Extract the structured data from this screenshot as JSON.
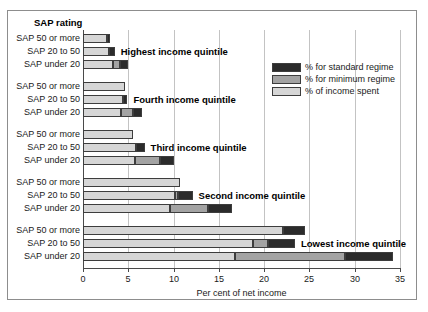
{
  "figure": {
    "sap_rating_title": "SAP rating",
    "axis_title": "Per cent of net income"
  },
  "legend": {
    "position": "top-right-inside",
    "items": [
      {
        "label": "% for standard regime",
        "color": "#2b2b2b",
        "key": "standard"
      },
      {
        "label": "% for minimum regime",
        "color": "#a3a3a3",
        "key": "minimum"
      },
      {
        "label": "% of income spent",
        "color": "#d6d6d6",
        "key": "spent"
      }
    ]
  },
  "chart_data": {
    "type": "bar",
    "orientation": "horizontal",
    "stacked": true,
    "title": "",
    "xlabel": "Per cent of net income",
    "ylabel": "SAP rating",
    "xlim": [
      0,
      35
    ],
    "xticks": [
      0,
      5,
      10,
      15,
      20,
      25,
      30,
      35
    ],
    "xticklabels": [
      "0",
      "5",
      "10",
      "15",
      "20",
      "25",
      "30",
      "35"
    ],
    "grid": "vertical",
    "series_order": [
      "spent",
      "minimum",
      "standard"
    ],
    "series": [
      {
        "name": "% of income spent",
        "color": "#d6d6d6"
      },
      {
        "name": "% for minimum regime",
        "color": "#a3a3a3"
      },
      {
        "name": "% for standard regime",
        "color": "#2b2b2b"
      }
    ],
    "groups": [
      {
        "label": "Highest income quintile",
        "categories": [
          "SAP 50 or more",
          "SAP 20 to 50",
          "SAP under 20"
        ],
        "rows": [
          {
            "category": "SAP 50 or more",
            "spent": 2.6,
            "minimum": 0.0,
            "standard": 0.4,
            "total": 3.0
          },
          {
            "category": "SAP 20 to 50",
            "spent": 2.9,
            "minimum": 0.0,
            "standard": 0.6,
            "total": 3.5
          },
          {
            "category": "SAP under 20",
            "spent": 3.3,
            "minimum": 0.8,
            "standard": 0.9,
            "total": 5.0
          }
        ]
      },
      {
        "label": "Fourth income quintile",
        "categories": [
          "SAP 50 or more",
          "SAP 20 to 50",
          "SAP under 20"
        ],
        "rows": [
          {
            "category": "SAP 50 or more",
            "spent": 4.6,
            "minimum": 0.0,
            "standard": 0.0,
            "total": 4.6
          },
          {
            "category": "SAP 20 to 50",
            "spent": 4.4,
            "minimum": 0.0,
            "standard": 0.5,
            "total": 4.9
          },
          {
            "category": "SAP under 20",
            "spent": 4.2,
            "minimum": 1.3,
            "standard": 1.0,
            "total": 6.5
          }
        ]
      },
      {
        "label": "Third income quintile",
        "categories": [
          "SAP 50 or more",
          "SAP 20 to 50",
          "SAP under 20"
        ],
        "rows": [
          {
            "category": "SAP 50 or more",
            "spent": 5.5,
            "minimum": 0.0,
            "standard": 0.0,
            "total": 5.5
          },
          {
            "category": "SAP 20 to 50",
            "spent": 5.9,
            "minimum": 0.0,
            "standard": 0.9,
            "total": 6.8
          },
          {
            "category": "SAP under 20",
            "spent": 5.7,
            "minimum": 2.8,
            "standard": 1.6,
            "total": 10.1
          }
        ]
      },
      {
        "label": "Second income quintile",
        "categories": [
          "SAP 50 or more",
          "SAP 20 to 50",
          "SAP under 20"
        ],
        "rows": [
          {
            "category": "SAP 50 or more",
            "spent": 10.7,
            "minimum": 0.0,
            "standard": 0.0,
            "total": 10.7
          },
          {
            "category": "SAP 20 to 50",
            "spent": 10.2,
            "minimum": 0.3,
            "standard": 1.6,
            "total": 12.1
          },
          {
            "category": "SAP under 20",
            "spent": 9.6,
            "minimum": 4.2,
            "standard": 2.7,
            "total": 16.5
          }
        ]
      },
      {
        "label": "Lowest income quintile",
        "categories": [
          "SAP 50 or more",
          "SAP 20 to 50",
          "SAP under 20"
        ],
        "rows": [
          {
            "category": "SAP 50 or more",
            "spent": 22.1,
            "minimum": 0.0,
            "standard": 2.4,
            "total": 24.5
          },
          {
            "category": "SAP 20 to 50",
            "spent": 18.8,
            "minimum": 1.6,
            "standard": 3.0,
            "total": 23.4
          },
          {
            "category": "SAP under 20",
            "spent": 16.8,
            "minimum": 12.1,
            "standard": 5.3,
            "total": 34.2
          }
        ]
      }
    ]
  }
}
